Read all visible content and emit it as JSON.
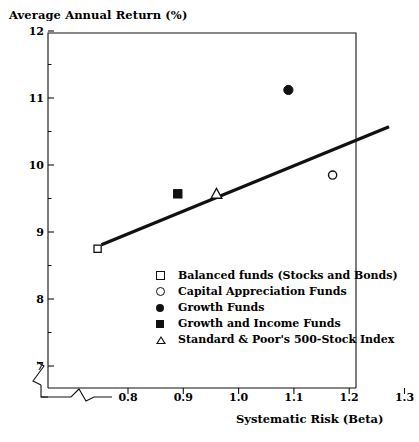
{
  "chart_data": {
    "type": "scatter",
    "title": "Average Annual Return (%)",
    "xlabel": "Systematic Risk (Beta)",
    "ylabel": "Average Annual Return (%)",
    "xlim": [
      0.72,
      1.3
    ],
    "ylim": [
      6.6,
      12
    ],
    "xticks": [
      "0.8",
      "0.9",
      "1.0",
      "1.1",
      "1.2",
      "1.3"
    ],
    "xtick_values": [
      0.8,
      0.9,
      1.0,
      1.1,
      1.2,
      1.3
    ],
    "yticks": [
      "12",
      "11",
      "10",
      "9",
      "8",
      "7"
    ],
    "ytick_values": [
      12,
      11,
      10,
      9,
      8,
      7
    ],
    "grid": false,
    "axis_break_x": true,
    "axis_break_y": true,
    "legend_position": "center-right inside plot",
    "series": [
      {
        "name": "Balanced funds (Stocks and Bonds)",
        "marker": "open-square",
        "points": [
          {
            "x": 0.745,
            "y": 8.75
          }
        ]
      },
      {
        "name": "Capital Appreciation Funds",
        "marker": "open-circle",
        "points": [
          {
            "x": 1.17,
            "y": 9.85
          }
        ]
      },
      {
        "name": "Growth Funds",
        "marker": "filled-circle",
        "points": [
          {
            "x": 1.09,
            "y": 11.12
          }
        ]
      },
      {
        "name": "Growth and Income Funds",
        "marker": "filled-square",
        "points": [
          {
            "x": 0.89,
            "y": 9.57
          }
        ]
      },
      {
        "name": "Standard & Poor's 500-Stock Index",
        "marker": "open-triangle",
        "points": [
          {
            "x": 0.96,
            "y": 9.57
          }
        ]
      }
    ],
    "trendline": {
      "name": "security market line",
      "x0": 0.752,
      "y0": 8.81,
      "x1": 1.272,
      "y1": 10.57,
      "color": "#111111"
    },
    "annotations": []
  },
  "legend": {
    "items": [
      {
        "marker": "open-square",
        "label": "Balanced funds (Stocks and Bonds)"
      },
      {
        "marker": "open-circle",
        "label": "Capital Appreciation Funds"
      },
      {
        "marker": "filled-circle",
        "label": "Growth Funds"
      },
      {
        "marker": "filled-square",
        "label": "Growth and Income Funds"
      },
      {
        "marker": "open-triangle",
        "label": "Standard & Poor's 500-Stock Index"
      }
    ]
  },
  "colors": {
    "axis": "#111111",
    "marker": "#111111",
    "trendline": "#111111",
    "background": "#ffffff"
  }
}
